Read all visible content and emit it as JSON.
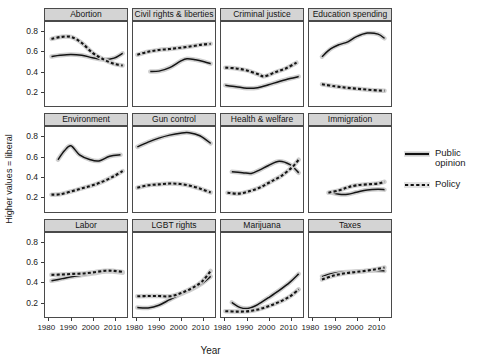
{
  "chart_data": {
    "type": "line",
    "title": "",
    "xlabel": "Year",
    "ylabel": "Higher values = liberal",
    "xlim": [
      1978,
      2016
    ],
    "ylim": [
      0.05,
      0.9
    ],
    "xticks": [
      1980,
      1990,
      2000,
      2010
    ],
    "xticklabels": [
      "1980",
      "1990",
      "2000",
      "2010"
    ],
    "yticks": [
      0.2,
      0.4,
      0.6,
      0.8
    ],
    "yticklabels": [
      "0.2",
      "0.4",
      "0.6",
      "0.8"
    ],
    "grid": false,
    "legend_position": "right",
    "legend": [
      {
        "name": "Public opinion",
        "style": "solid",
        "color": "#111111"
      },
      {
        "name": "Policy",
        "style": "dashed",
        "color": "#111111"
      }
    ],
    "facets": [
      {
        "name": "Abortion",
        "series": [
          {
            "name": "Public opinion",
            "style": "solid",
            "x": [
              1981,
              1985,
              1990,
              1995,
              2000,
              2005,
              2010,
              2014
            ],
            "y": [
              0.552,
              0.565,
              0.573,
              0.565,
              0.54,
              0.521,
              0.536,
              0.585
            ]
          },
          {
            "name": "Policy",
            "style": "dashed",
            "x": [
              1981,
              1985,
              1990,
              1995,
              2000,
              2005,
              2010,
              2014
            ],
            "y": [
              0.73,
              0.748,
              0.75,
              0.69,
              0.59,
              0.525,
              0.478,
              0.462
            ]
          }
        ]
      },
      {
        "name": "Civil rights & liberties",
        "series": [
          {
            "name": "Public opinion",
            "style": "solid",
            "x": [
              1986,
              1990,
              1995,
              2000,
              2003,
              2007,
              2011,
              2014
            ],
            "y": [
              0.4,
              0.405,
              0.44,
              0.505,
              0.53,
              0.52,
              0.5,
              0.48
            ]
          },
          {
            "name": "Policy",
            "style": "dashed",
            "x": [
              1980,
              1985,
              1990,
              1995,
              2000,
              2005,
              2010,
              2014
            ],
            "y": [
              0.57,
              0.6,
              0.618,
              0.628,
              0.64,
              0.655,
              0.672,
              0.68
            ]
          }
        ]
      },
      {
        "name": "Criminal justice",
        "series": [
          {
            "name": "Public opinion",
            "style": "solid",
            "x": [
              1980,
              1985,
              1990,
              1995,
              2000,
              2005,
              2010,
              2014
            ],
            "y": [
              0.262,
              0.248,
              0.232,
              0.238,
              0.268,
              0.3,
              0.33,
              0.35
            ]
          },
          {
            "name": "Policy",
            "style": "dashed",
            "x": [
              1980,
              1985,
              1990,
              1995,
              1998,
              2003,
              2008,
              2013
            ],
            "y": [
              0.44,
              0.432,
              0.412,
              0.375,
              0.352,
              0.392,
              0.432,
              0.49
            ]
          }
        ]
      },
      {
        "name": "Education spending",
        "series": [
          {
            "name": "Public opinion",
            "style": "solid",
            "x": [
              1984,
              1988,
              1992,
              1996,
              2000,
              2005,
              2010,
              2013
            ],
            "y": [
              0.55,
              0.628,
              0.672,
              0.7,
              0.752,
              0.788,
              0.778,
              0.735
            ]
          },
          {
            "name": "Policy",
            "style": "dashed",
            "x": [
              1984,
              1990,
              1995,
              2000,
              2005,
              2010,
              2013
            ],
            "y": [
              0.272,
              0.252,
              0.238,
              0.228,
              0.218,
              0.21,
              0.208
            ]
          }
        ]
      },
      {
        "name": "Environment",
        "series": [
          {
            "name": "Public opinion",
            "style": "solid",
            "x": [
              1984,
              1987,
              1990,
              1994,
              1999,
              2003,
              2008,
              2013
            ],
            "y": [
              0.57,
              0.66,
              0.71,
              0.62,
              0.57,
              0.558,
              0.605,
              0.62
            ]
          },
          {
            "name": "Policy",
            "style": "dashed",
            "x": [
              1981,
              1985,
              1990,
              1995,
              2000,
              2005,
              2010,
              2014
            ],
            "y": [
              0.218,
              0.222,
              0.25,
              0.282,
              0.312,
              0.352,
              0.405,
              0.455
            ]
          }
        ]
      },
      {
        "name": "Gun control",
        "series": [
          {
            "name": "Public opinion",
            "style": "solid",
            "x": [
              1980,
              1985,
              1990,
              1995,
              2000,
              2004,
              2009,
              2014
            ],
            "y": [
              0.7,
              0.748,
              0.788,
              0.818,
              0.838,
              0.842,
              0.812,
              0.735
            ]
          },
          {
            "name": "Policy",
            "style": "dashed",
            "x": [
              1980,
              1985,
              1990,
              1995,
              2000,
              2005,
              2010,
              2014
            ],
            "y": [
              0.288,
              0.312,
              0.322,
              0.33,
              0.325,
              0.305,
              0.272,
              0.24
            ]
          }
        ]
      },
      {
        "name": "Health & welfare",
        "series": [
          {
            "name": "Public opinion",
            "style": "solid",
            "x": [
              1983,
              1988,
              1992,
              1996,
              2000,
              2005,
              2010,
              2014
            ],
            "y": [
              0.448,
              0.44,
              0.432,
              0.468,
              0.512,
              0.555,
              0.52,
              0.438
            ]
          },
          {
            "name": "Policy",
            "style": "dashed",
            "x": [
              1981,
              1986,
              1991,
              1996,
              2001,
              2006,
              2011,
              2014
            ],
            "y": [
              0.238,
              0.228,
              0.252,
              0.29,
              0.348,
              0.408,
              0.495,
              0.57
            ]
          }
        ]
      },
      {
        "name": "Immigration",
        "series": [
          {
            "name": "Public opinion",
            "style": "solid",
            "x": [
              1988,
              1992,
              1996,
              2000,
              2005,
              2010,
              2013
            ],
            "y": [
              0.242,
              0.222,
              0.222,
              0.242,
              0.265,
              0.272,
              0.268
            ]
          },
          {
            "name": "Policy",
            "style": "dashed",
            "x": [
              1987,
              1992,
              1996,
              2000,
              2005,
              2010,
              2013
            ],
            "y": [
              0.238,
              0.262,
              0.292,
              0.312,
              0.322,
              0.33,
              0.348
            ]
          }
        ]
      },
      {
        "name": "Labor",
        "series": [
          {
            "name": "Public opinion",
            "style": "solid",
            "x": [
              1981,
              1986,
              1991,
              1996,
              2001,
              2006,
              2010,
              2014
            ],
            "y": [
              0.418,
              0.44,
              0.462,
              0.478,
              0.495,
              0.512,
              0.51,
              0.5
            ]
          },
          {
            "name": "Policy",
            "style": "dashed",
            "x": [
              1981,
              1986,
              1991,
              1996,
              2001,
              2006,
              2010,
              2014
            ],
            "y": [
              0.478,
              0.482,
              0.488,
              0.492,
              0.505,
              0.52,
              0.518,
              0.508
            ]
          }
        ]
      },
      {
        "name": "LGBT rights",
        "series": [
          {
            "name": "Public opinion",
            "style": "solid",
            "x": [
              1980,
              1985,
              1990,
              1995,
              2000,
              2005,
              2010,
              2014
            ],
            "y": [
              0.148,
              0.145,
              0.172,
              0.228,
              0.282,
              0.33,
              0.392,
              0.462
            ]
          },
          {
            "name": "Policy",
            "style": "dashed",
            "x": [
              1980,
              1985,
              1990,
              1995,
              2000,
              2005,
              2010,
              2014
            ],
            "y": [
              0.262,
              0.265,
              0.265,
              0.262,
              0.292,
              0.34,
              0.412,
              0.518
            ]
          }
        ]
      },
      {
        "name": "Marijuana",
        "series": [
          {
            "name": "Public opinion",
            "style": "solid",
            "x": [
              1983,
              1987,
              1991,
              1995,
              2000,
              2005,
              2010,
              2014
            ],
            "y": [
              0.2,
              0.148,
              0.142,
              0.178,
              0.248,
              0.322,
              0.405,
              0.488
            ]
          },
          {
            "name": "Policy",
            "style": "dashed",
            "x": [
              1980,
              1985,
              1990,
              1995,
              2000,
              2005,
              2010,
              2014
            ],
            "y": [
              0.112,
              0.108,
              0.11,
              0.128,
              0.162,
              0.205,
              0.262,
              0.332
            ]
          }
        ]
      },
      {
        "name": "Taxes",
        "series": [
          {
            "name": "Public opinion",
            "style": "solid",
            "x": [
              1984,
              1989,
              1994,
              1999,
              2004,
              2009,
              2013
            ],
            "y": [
              0.462,
              0.492,
              0.505,
              0.512,
              0.518,
              0.522,
              0.518
            ]
          },
          {
            "name": "Policy",
            "style": "dashed",
            "x": [
              1984,
              1989,
              1994,
              1999,
              2004,
              2009,
              2013
            ],
            "y": [
              0.432,
              0.468,
              0.492,
              0.505,
              0.518,
              0.535,
              0.552
            ]
          }
        ]
      }
    ]
  },
  "axes": {
    "ylabel": "Higher values = liberal",
    "xlabel": "Year"
  },
  "legend": {
    "public_line1": "Public",
    "public_line2": "opinion",
    "policy": "Policy"
  }
}
